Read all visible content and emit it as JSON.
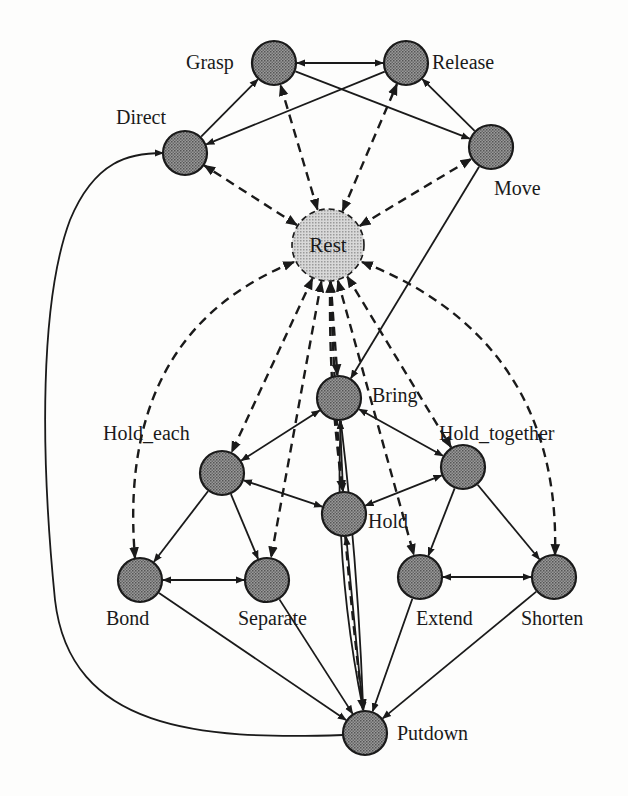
{
  "diagram": {
    "colors": {
      "node_fill": "#8a8a8a",
      "rest_fill": "#c8c8c8",
      "stroke": "#1a1a1a",
      "background": "#fdfdfc"
    },
    "nodes": [
      {
        "id": "grasp",
        "label": "Grasp",
        "x": 274,
        "y": 63,
        "r": 22,
        "lx": 186,
        "ly": 69
      },
      {
        "id": "release",
        "label": "Release",
        "x": 406,
        "y": 63,
        "r": 22,
        "lx": 432,
        "ly": 69
      },
      {
        "id": "direct",
        "label": "Direct",
        "x": 185,
        "y": 153,
        "r": 22,
        "lx": 116,
        "ly": 124
      },
      {
        "id": "move",
        "label": "Move",
        "x": 491,
        "y": 147,
        "r": 22,
        "lx": 494,
        "ly": 195
      },
      {
        "id": "rest",
        "label": "Rest",
        "x": 328,
        "y": 245,
        "r": 36,
        "lx": 328,
        "ly": 252,
        "kind": "rest"
      },
      {
        "id": "bring",
        "label": "Bring",
        "x": 339,
        "y": 398,
        "r": 22,
        "lx": 372,
        "ly": 402
      },
      {
        "id": "hold_each",
        "label": "Hold_each",
        "x": 222,
        "y": 473,
        "r": 22,
        "lx": 103,
        "ly": 440
      },
      {
        "id": "hold_together",
        "label": "Hold_together",
        "x": 463,
        "y": 467,
        "r": 22,
        "lx": 439,
        "ly": 440
      },
      {
        "id": "hold",
        "label": "Hold",
        "x": 344,
        "y": 514,
        "r": 22,
        "lx": 368,
        "ly": 528
      },
      {
        "id": "bond",
        "label": "Bond",
        "x": 140,
        "y": 580,
        "r": 22,
        "lx": 106,
        "ly": 625
      },
      {
        "id": "separate",
        "label": "Separate",
        "x": 267,
        "y": 580,
        "r": 22,
        "lx": 238,
        "ly": 625
      },
      {
        "id": "extend",
        "label": "Extend",
        "x": 420,
        "y": 577,
        "r": 22,
        "lx": 416,
        "ly": 625
      },
      {
        "id": "shorten",
        "label": "Shorten",
        "x": 554,
        "y": 577,
        "r": 22,
        "lx": 521,
        "ly": 625
      },
      {
        "id": "putdown",
        "label": "Putdown",
        "x": 365,
        "y": 733,
        "r": 22,
        "lx": 397,
        "ly": 740
      }
    ],
    "edges": [
      {
        "from": "grasp",
        "to": "release",
        "style": "solid",
        "bidir": true
      },
      {
        "from": "direct",
        "to": "grasp",
        "style": "solid",
        "bidir": false
      },
      {
        "from": "release",
        "to": "direct",
        "style": "solid",
        "bidir": false
      },
      {
        "from": "grasp",
        "to": "move",
        "style": "solid",
        "bidir": false
      },
      {
        "from": "move",
        "to": "release",
        "style": "solid",
        "bidir": false
      },
      {
        "from": "move",
        "to": "bring",
        "style": "solid",
        "bidir": false
      },
      {
        "from": "bring",
        "to": "hold_each",
        "style": "solid",
        "bidir": true
      },
      {
        "from": "bring",
        "to": "hold_together",
        "style": "solid",
        "bidir": true
      },
      {
        "from": "bring",
        "to": "hold",
        "style": "solid",
        "bidir": true
      },
      {
        "from": "hold",
        "to": "hold_each",
        "style": "solid",
        "bidir": true
      },
      {
        "from": "hold",
        "to": "hold_together",
        "style": "solid",
        "bidir": true
      },
      {
        "from": "hold_each",
        "to": "bond",
        "style": "solid",
        "bidir": false
      },
      {
        "from": "hold_each",
        "to": "separate",
        "style": "solid",
        "bidir": false
      },
      {
        "from": "hold_together",
        "to": "extend",
        "style": "solid",
        "bidir": false
      },
      {
        "from": "hold_together",
        "to": "shorten",
        "style": "solid",
        "bidir": false
      },
      {
        "from": "bond",
        "to": "separate",
        "style": "solid",
        "bidir": true
      },
      {
        "from": "extend",
        "to": "shorten",
        "style": "solid",
        "bidir": true
      },
      {
        "from": "bond",
        "to": "putdown",
        "style": "solid",
        "bidir": false
      },
      {
        "from": "separate",
        "to": "putdown",
        "style": "solid",
        "bidir": false
      },
      {
        "from": "extend",
        "to": "putdown",
        "style": "solid",
        "bidir": false
      },
      {
        "from": "shorten",
        "to": "putdown",
        "style": "solid",
        "bidir": false
      },
      {
        "from": "putdown",
        "to": "hold",
        "style": "solid",
        "bidir": false
      },
      {
        "from": "putdown",
        "to": "bring",
        "style": "solid",
        "bidir": false,
        "curve": -18
      },
      {
        "from": "bring",
        "to": "putdown",
        "style": "solid",
        "bidir": false,
        "curve": -6
      },
      {
        "from": "putdown",
        "to": "direct",
        "style": "solid",
        "bidir": false,
        "path": "M343,735 C200,740 70,730 55,600 C40,450 40,300 70,220 C95,160 130,153 163,153"
      },
      {
        "from": "rest",
        "to": "grasp",
        "style": "dashed",
        "bidir": true
      },
      {
        "from": "rest",
        "to": "release",
        "style": "dashed",
        "bidir": true
      },
      {
        "from": "rest",
        "to": "direct",
        "style": "dashed",
        "bidir": true
      },
      {
        "from": "rest",
        "to": "move",
        "style": "dashed",
        "bidir": true
      },
      {
        "from": "rest",
        "to": "bring",
        "style": "dashed",
        "bidir": false
      },
      {
        "from": "rest",
        "to": "hold",
        "style": "dashed",
        "bidir": true,
        "curve": 8
      },
      {
        "from": "rest",
        "to": "hold_each",
        "style": "dashed",
        "bidir": true
      },
      {
        "from": "rest",
        "to": "hold_together",
        "style": "dashed",
        "bidir": true
      },
      {
        "from": "rest",
        "to": "bond",
        "style": "dashed",
        "bidir": true,
        "path": "M294,262 C200,300 120,380 135,558"
      },
      {
        "from": "rest",
        "to": "separate",
        "style": "dashed",
        "bidir": true
      },
      {
        "from": "rest",
        "to": "extend",
        "style": "dashed",
        "bidir": true
      },
      {
        "from": "rest",
        "to": "shorten",
        "style": "dashed",
        "bidir": true,
        "path": "M362,262 C460,300 560,380 555,555"
      },
      {
        "from": "rest",
        "to": "putdown",
        "style": "dashed",
        "bidir": true,
        "curve": 10
      }
    ]
  }
}
